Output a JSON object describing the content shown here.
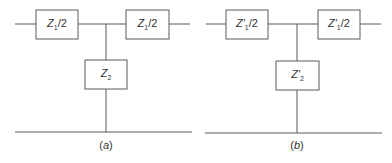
{
  "diagrams": [
    {
      "caption": "(a)",
      "caption_letter": "a",
      "series_left": {
        "base": "Z",
        "prime": "",
        "sub": "1",
        "suffix": "/2"
      },
      "series_right": {
        "base": "Z",
        "prime": "",
        "sub": "1",
        "suffix": "/2"
      },
      "shunt": {
        "base": "Z",
        "prime": "",
        "sub": "2",
        "suffix": ""
      }
    },
    {
      "caption": "(b)",
      "caption_letter": "b",
      "series_left": {
        "base": "Z",
        "prime": "′",
        "sub": "1",
        "suffix": "/2"
      },
      "series_right": {
        "base": "Z",
        "prime": "′",
        "sub": "1",
        "suffix": "/2"
      },
      "shunt": {
        "base": "Z",
        "prime": "′",
        "sub": "2",
        "suffix": ""
      }
    }
  ],
  "colors": {
    "line": "#5a5a5a",
    "text": "#333333",
    "background": "#ffffff"
  }
}
